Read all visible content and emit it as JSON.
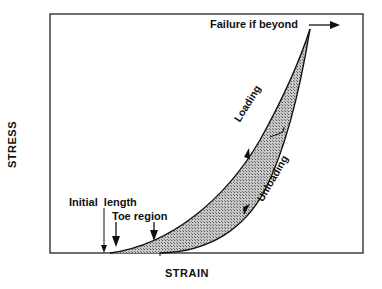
{
  "diagram": {
    "axes": {
      "x_label": "STRAIN",
      "y_label": "STRESS"
    },
    "annotations": {
      "failure": "Failure if beyond",
      "initial_length": "Initial  length",
      "toe_region": "Toe region",
      "loading": "Loading",
      "unloading": "Unloading"
    },
    "colors": {
      "line": "#111111",
      "fill": "#9a9a9a",
      "background": "#ffffff"
    }
  }
}
